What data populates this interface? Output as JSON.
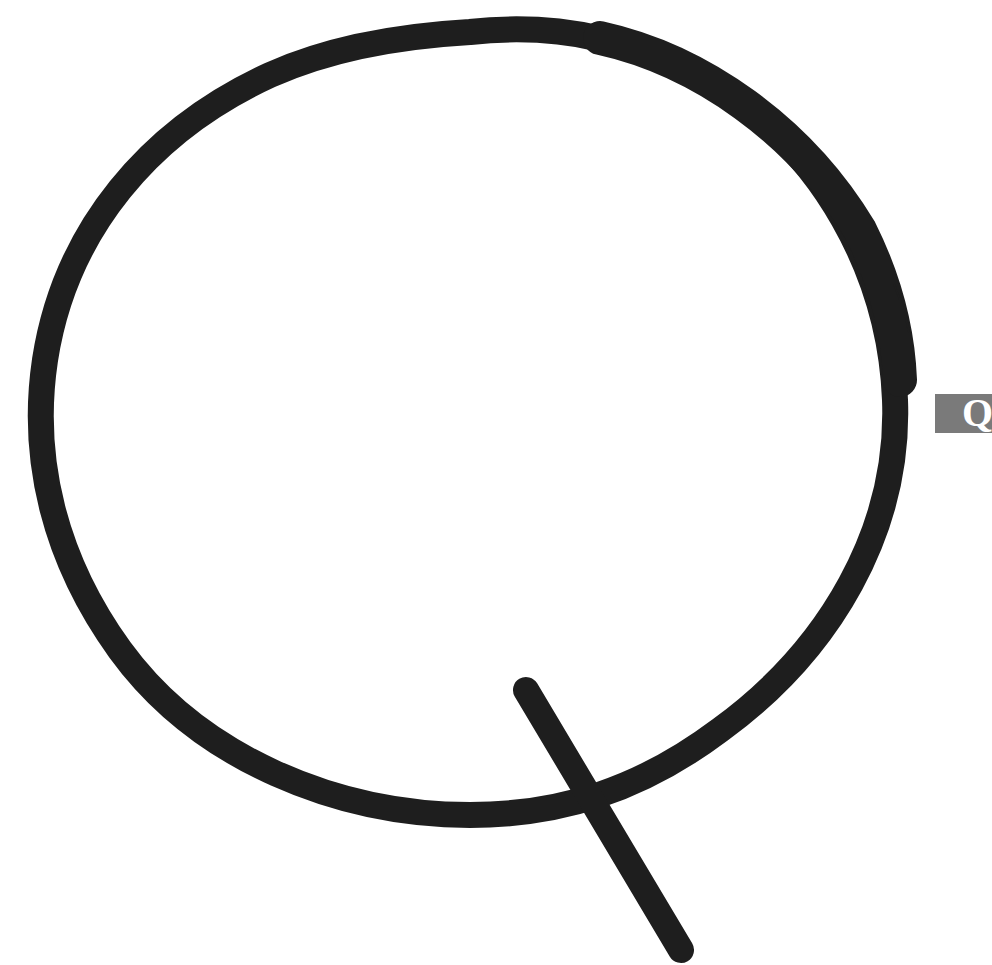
{
  "artwork": {
    "letter": "Q",
    "stroke_color": "#1e1e1e",
    "background_color": "#ffffff",
    "style": "brush-stroke"
  },
  "side_tab": {
    "label": "Q",
    "background_color": "#7a7a7a",
    "text_color": "#ffffff"
  }
}
